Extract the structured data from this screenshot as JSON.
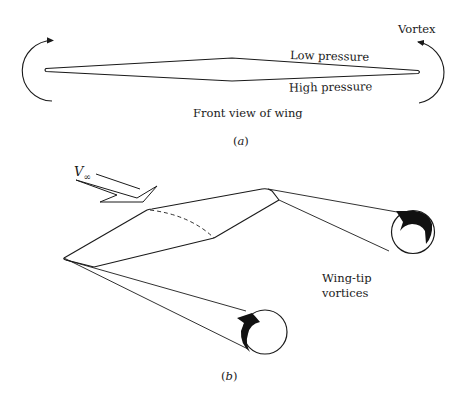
{
  "figure_a": {
    "caption": "(a)",
    "title": "Front view of wing",
    "labels": {
      "vortex": "Vortex",
      "low_pressure": "Low pressure",
      "high_pressure": "High pressure"
    }
  },
  "figure_b": {
    "caption": "(b)",
    "freestream_label": "V",
    "freestream_subscript": "∞",
    "vortices_label_line1": "Wing-tip",
    "vortices_label_line2": "vortices"
  },
  "colors": {
    "stroke": "#1a1a1a",
    "background": "#ffffff"
  }
}
